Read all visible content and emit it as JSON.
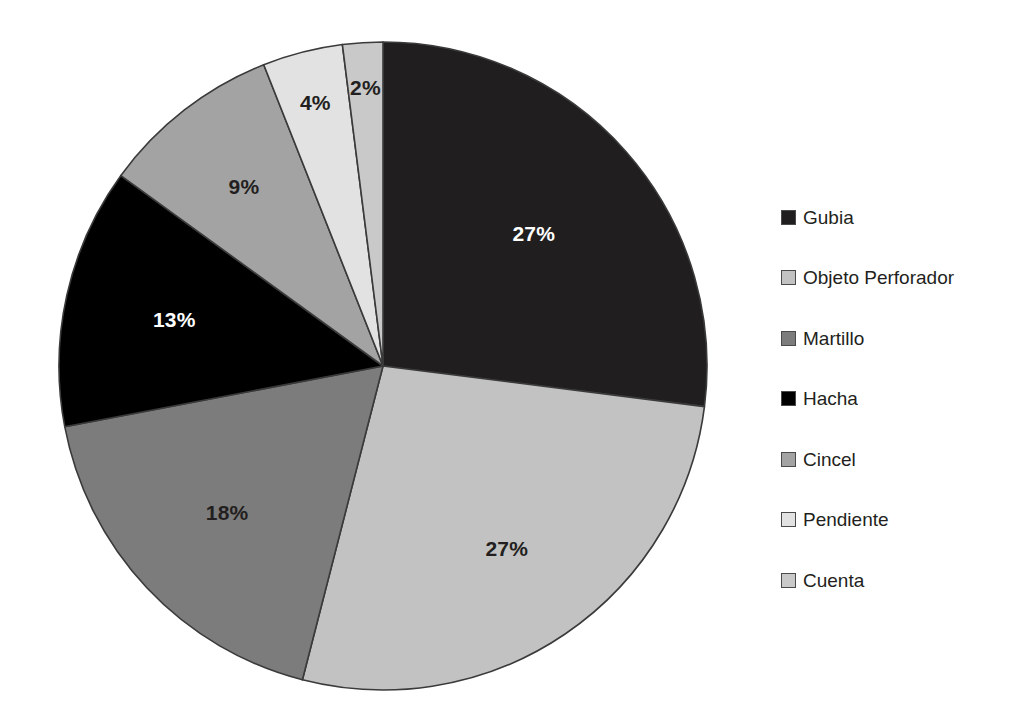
{
  "chart_data": {
    "type": "pie",
    "title": "",
    "subtitle": "",
    "xlabel": "",
    "ylabel": "",
    "legend_position": "right",
    "grid": false,
    "start_angle_deg": 0,
    "direction": "clockwise",
    "categories": [
      "Gubia",
      "Objeto Perforador",
      "Martillo",
      "Hacha",
      "Cincel",
      "Pendiente",
      "Cuenta"
    ],
    "values": [
      27,
      27,
      18,
      13,
      9,
      4,
      2
    ],
    "value_unit": "%",
    "data_labels": [
      "27%",
      "27%",
      "18%",
      "13%",
      "9%",
      "4%",
      "2%"
    ],
    "slice_colors": [
      "#201e1e",
      "#c2c2c2",
      "#7c7c7c",
      "#000000",
      "#a3a3a3",
      "#e2e2e2",
      "#c9c9c9"
    ],
    "label_colors": [
      "#ffffff",
      "#231f20",
      "#231f20",
      "#ffffff",
      "#231f20",
      "#231f20",
      "#231f20"
    ],
    "slices": [
      {
        "name": "Gubia",
        "value": 27,
        "label": "27%",
        "color": "#201e1e",
        "label_color": "#ffffff"
      },
      {
        "name": "Objeto Perforador",
        "value": 27,
        "label": "27%",
        "color": "#c2c2c2",
        "label_color": "#231f20"
      },
      {
        "name": "Martillo",
        "value": 18,
        "label": "18%",
        "color": "#7c7c7c",
        "label_color": "#231f20"
      },
      {
        "name": "Hacha",
        "value": 13,
        "label": "13%",
        "color": "#000000",
        "label_color": "#ffffff"
      },
      {
        "name": "Cincel",
        "value": 9,
        "label": "9%",
        "color": "#a3a3a3",
        "label_color": "#231f20"
      },
      {
        "name": "Pendiente",
        "value": 4,
        "label": "4%",
        "color": "#e2e2e2",
        "label_color": "#231f20"
      },
      {
        "name": "Cuenta",
        "value": 2,
        "label": "2%",
        "color": "#c9c9c9",
        "label_color": "#231f20"
      }
    ]
  },
  "pie": {
    "labels": {
      "gubia": "27%",
      "objeto_perforador": "27%",
      "martillo": "18%",
      "hacha": "13%",
      "cincel": "9%",
      "pendiente": "4%",
      "cuenta": "2%"
    }
  },
  "legend": {
    "items": [
      {
        "label": "Gubia",
        "color": "#201e1e"
      },
      {
        "label": "Objeto Perforador",
        "color": "#c2c2c2"
      },
      {
        "label": "Martillo",
        "color": "#7c7c7c"
      },
      {
        "label": "Hacha",
        "color": "#000000"
      },
      {
        "label": "Cincel",
        "color": "#a3a3a3"
      },
      {
        "label": "Pendiente",
        "color": "#e2e2e2"
      },
      {
        "label": "Cuenta",
        "color": "#c9c9c9"
      }
    ]
  },
  "style": {
    "background": "#ffffff",
    "slice_outline": "#3a3a3a",
    "text_color": "#231f20"
  }
}
